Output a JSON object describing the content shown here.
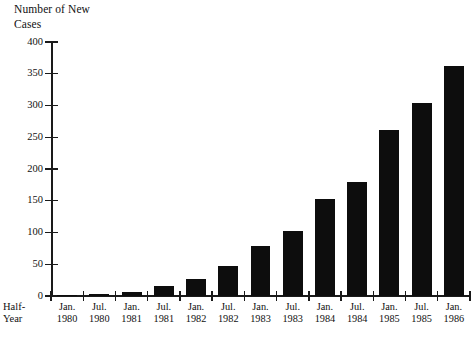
{
  "chart_data": {
    "type": "bar",
    "title": "Number of New\nCases",
    "xlabel": "Half-\nYear",
    "ylabel": "",
    "ylim": [
      0,
      400
    ],
    "ytick_step": 50,
    "yticks": [
      0,
      50,
      100,
      150,
      200,
      250,
      300,
      350,
      400
    ],
    "grid": false,
    "legend": "none",
    "bar_color": "#0d0d0d",
    "axis_color": "#1a1a1a",
    "categories": [
      "Jan.\n1980",
      "Jul.\n1980",
      "Jan.\n1981",
      "Jul.\n1981",
      "Jan.\n1982",
      "Jul.\n1982",
      "Jan.\n1983",
      "Jul.\n1983",
      "Jan.\n1984",
      "Jul.\n1984",
      "Jan.\n1985",
      "Jul.\n1985",
      "Jan.\n1986"
    ],
    "values": [
      1,
      3,
      7,
      15,
      27,
      48,
      78,
      102,
      152,
      179,
      262,
      304,
      363
    ]
  }
}
